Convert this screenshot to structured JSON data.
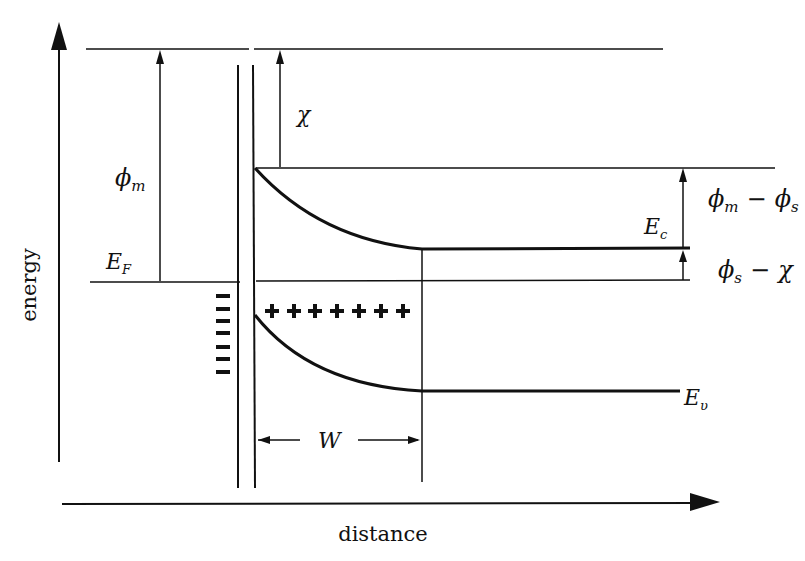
{
  "diagram": {
    "axes": {
      "y_label": "energy",
      "x_label": "distance"
    },
    "labels": {
      "phi_m": "ϕ",
      "phi_m_sub": "m",
      "chi": "χ",
      "E_F": "E",
      "E_F_sub": "F",
      "E_c": "E",
      "E_c_sub": "c",
      "E_v": "E",
      "E_v_sub": "υ",
      "W": "W",
      "phi_m_minus_phi_s": {
        "a": "ϕ",
        "a_sub": "m",
        "op": "−",
        "b": "ϕ",
        "b_sub": "s"
      },
      "phi_s_minus_chi": {
        "a": "ϕ",
        "a_sub": "s",
        "op": "−",
        "b": "χ"
      }
    },
    "charges": {
      "metal_side": "−",
      "metal_count": 7,
      "semiconductor_side": "+",
      "semiconductor_count": 7
    },
    "colors": {
      "line": "#111111",
      "background": "#ffffff"
    }
  }
}
